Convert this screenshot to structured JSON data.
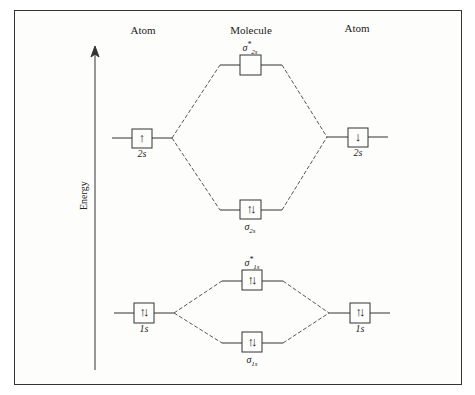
{
  "headers": {
    "left": "Atom",
    "center": "Molecule",
    "right": "Atom"
  },
  "axis": {
    "label": "Energy",
    "direction": "up"
  },
  "orbitals": {
    "sigma2s_star": {
      "symbol": "σ",
      "sub": "2s",
      "sup": "*",
      "electrons": ""
    },
    "sigma2s": {
      "symbol": "σ",
      "sub": "2s",
      "sup": "",
      "electrons": "↑↓"
    },
    "sigma1s_star": {
      "symbol": "σ",
      "sub": "1s",
      "sup": "*",
      "electrons": "↑↓"
    },
    "sigma1s": {
      "symbol": "σ",
      "sub": "1s",
      "sup": "",
      "electrons": "↑↓"
    },
    "left2s": {
      "label": "2s",
      "electrons": "↑"
    },
    "right2s": {
      "label": "2s",
      "electrons": "↓"
    },
    "left1s": {
      "label": "1s",
      "electrons": "↑↓"
    },
    "right1s": {
      "label": "1s",
      "electrons": "↑↓"
    }
  },
  "colors": {
    "line": "#333333",
    "frame": "#333333"
  }
}
